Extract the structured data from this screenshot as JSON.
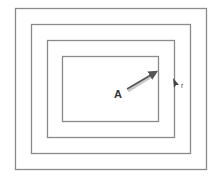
{
  "diagram": {
    "title": "",
    "shape": "concentric-rectangles",
    "rectangle_count": 4,
    "labels": {
      "vector": "A",
      "point": "r"
    },
    "colors": {
      "line": "#8a8a8a",
      "arrow": "#555555",
      "arrow_shadow": "#c8c8c8",
      "text": "#333333",
      "background": "#ffffff"
    }
  }
}
